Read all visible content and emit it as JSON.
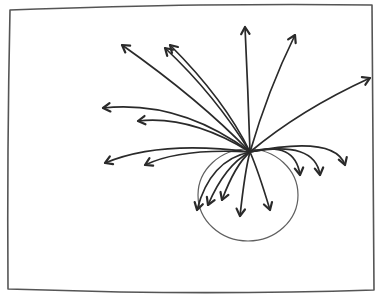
{
  "colors": {
    "ink": "#2a2a2a",
    "paper": "#ffffff"
  },
  "elements": {
    "frame": "rectangle-frame",
    "circle": "circle",
    "arrow_count": 17
  }
}
